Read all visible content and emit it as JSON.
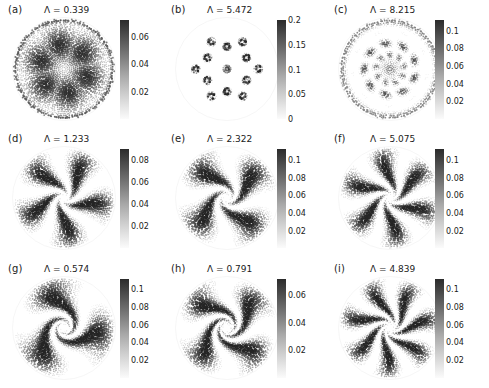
{
  "figure": {
    "type": "multi-panel-scatter-density-grid",
    "rows": 3,
    "cols": 3,
    "background": "#ffffff",
    "colormap": "grayscale-reversed",
    "colormap_dark": "#2b2b2b",
    "colormap_light": "#fbfbfb",
    "shared_domain": "unit-disk"
  },
  "chart_data": {
    "type": "scatter",
    "title": "",
    "xlabel": "",
    "ylabel": "",
    "grid": false,
    "legend": "none",
    "panels": [
      {
        "id": "a",
        "label": "(a)",
        "title": "Λ = 0.339",
        "lambda": 0.339,
        "colorbar": {
          "ticks": [
            "0.02",
            "0.04",
            "0.06"
          ],
          "values": [
            0.02,
            0.04,
            0.06
          ],
          "vmin": 0,
          "vmax": 0.072,
          "position": "right"
        },
        "pattern": "six-fold-blobs",
        "blob_count": 6,
        "blob_radius": 0.48,
        "blob_size": 0.26,
        "seed": 11
      },
      {
        "id": "b",
        "label": "(b)",
        "title": "Λ = 5.472",
        "lambda": 5.472,
        "colorbar": {
          "ticks": [
            "0",
            "0.05",
            "0.1",
            "0.15",
            "0.2"
          ],
          "values": [
            0,
            0.05,
            0.1,
            0.15,
            0.2
          ],
          "vmin": 0,
          "vmax": 0.2,
          "position": "right"
        },
        "pattern": "ring-of-vortices",
        "blob_count": 12,
        "blob_radius": 0.62,
        "blob_size": 0.05,
        "seed": 22
      },
      {
        "id": "c",
        "label": "(c)",
        "title": "Λ = 8.215",
        "lambda": 8.215,
        "colorbar": {
          "ticks": [
            "0.02",
            "0.04",
            "0.06",
            "0.08",
            "0.1"
          ],
          "values": [
            0.02,
            0.04,
            0.06,
            0.08,
            0.1
          ],
          "vmin": 0,
          "vmax": 0.112,
          "position": "right"
        },
        "pattern": "concentric-lattice",
        "blob_count": 9,
        "blob_radius": 0.44,
        "blob_size": 0.2,
        "seed": 33
      },
      {
        "id": "d",
        "label": "(d)",
        "title": "Λ = 1.233",
        "lambda": 1.233,
        "colorbar": {
          "ticks": [
            "0.02",
            "0.04",
            "0.06",
            "0.08"
          ],
          "values": [
            0.02,
            0.04,
            0.06,
            0.08
          ],
          "vmin": 0,
          "vmax": 0.09,
          "position": "right"
        },
        "pattern": "spiral-arms",
        "arms": 5,
        "twist": 2.3,
        "seed": 44
      },
      {
        "id": "e",
        "label": "(e)",
        "title": "Λ = 2.322",
        "lambda": 2.322,
        "colorbar": {
          "ticks": [
            "0.02",
            "0.04",
            "0.06",
            "0.08",
            "0.1"
          ],
          "values": [
            0.02,
            0.04,
            0.06,
            0.08,
            0.1
          ],
          "vmin": 0,
          "vmax": 0.112,
          "position": "right"
        },
        "pattern": "spiral-arms",
        "arms": 4,
        "twist": 3.1,
        "seed": 55
      },
      {
        "id": "f",
        "label": "(f)",
        "title": "Λ = 5.075",
        "lambda": 5.075,
        "colorbar": {
          "ticks": [
            "0.02",
            "0.04",
            "0.06",
            "0.08",
            "0.1"
          ],
          "values": [
            0.02,
            0.04,
            0.06,
            0.08,
            0.1
          ],
          "vmin": 0,
          "vmax": 0.112,
          "position": "right"
        },
        "pattern": "spiral-arms",
        "arms": 6,
        "twist": 2.7,
        "seed": 66
      },
      {
        "id": "g",
        "label": "(g)",
        "title": "Λ = 0.574",
        "lambda": 0.574,
        "colorbar": {
          "ticks": [
            "0.02",
            "0.04",
            "0.06",
            "0.08",
            "0.1"
          ],
          "values": [
            0.02,
            0.04,
            0.06,
            0.08,
            0.1
          ],
          "vmin": 0,
          "vmax": 0.112,
          "position": "right"
        },
        "pattern": "spiral-arms",
        "arms": 3,
        "twist": 4.2,
        "seed": 77
      },
      {
        "id": "h",
        "label": "(h)",
        "title": "Λ = 0.791",
        "lambda": 0.791,
        "colorbar": {
          "ticks": [
            "0.02",
            "0.04",
            "0.06"
          ],
          "values": [
            0.02,
            0.04,
            0.06
          ],
          "vmin": 0,
          "vmax": 0.072,
          "position": "right"
        },
        "pattern": "spiral-arms",
        "arms": 4,
        "twist": 5.0,
        "seed": 88
      },
      {
        "id": "i",
        "label": "(i)",
        "title": "Λ = 4.839",
        "lambda": 4.839,
        "colorbar": {
          "ticks": [
            "0.02",
            "0.04",
            "0.06",
            "0.08",
            "0.1"
          ],
          "values": [
            0.02,
            0.04,
            0.06,
            0.08,
            0.1
          ],
          "vmin": 0,
          "vmax": 0.112,
          "position": "right"
        },
        "pattern": "spiral-arms",
        "arms": 7,
        "twist": 3.6,
        "seed": 99
      }
    ]
  }
}
